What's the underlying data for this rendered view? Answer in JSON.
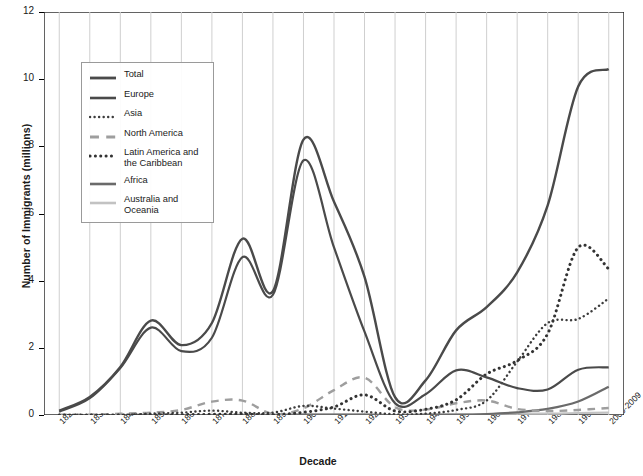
{
  "chart_data": {
    "type": "line",
    "title": "",
    "xlabel": "Decade",
    "ylabel": "Number of Immigrants (millions)",
    "ylim": [
      0,
      12
    ],
    "yticks": [
      0,
      2,
      4,
      6,
      8,
      10,
      12
    ],
    "grid": "vertical",
    "legend_position": "upper-left",
    "categories": [
      "1820-1829",
      "1830-1839",
      "1840-1849",
      "1850-1859",
      "1860-1869",
      "1870-1879",
      "1880-1889",
      "1890-1899",
      "1900-1909",
      "1910-1919",
      "1920-1929",
      "1930-1939",
      "1940-1949",
      "1950-1959",
      "1960-1969",
      "1970-1979",
      "1980-1989",
      "1990-1999",
      "2000-2009"
    ],
    "series": [
      {
        "name": "Total",
        "style": "solid",
        "color": "#4a4a4a",
        "width": 2.4,
        "values": [
          0.13,
          0.54,
          1.43,
          2.81,
          2.08,
          2.74,
          5.25,
          3.69,
          8.2,
          6.35,
          4.11,
          0.53,
          1.03,
          2.52,
          3.21,
          4.25,
          6.24,
          9.78,
          10.3
        ]
      },
      {
        "name": "Europe",
        "style": "solid",
        "color": "#4a4a4a",
        "width": 2.2,
        "values": [
          0.1,
          0.5,
          1.4,
          2.6,
          1.9,
          2.3,
          4.7,
          3.58,
          7.58,
          4.99,
          2.48,
          0.35,
          0.62,
          1.33,
          1.12,
          0.8,
          0.76,
          1.35,
          1.42
        ]
      },
      {
        "name": "Asia",
        "style": "fine-dotted",
        "color": "#3c3c3c",
        "width": 2.4,
        "values": [
          0.0,
          0.0,
          0.0,
          0.04,
          0.07,
          0.13,
          0.07,
          0.07,
          0.27,
          0.19,
          0.1,
          0.02,
          0.04,
          0.15,
          0.43,
          1.59,
          2.74,
          2.86,
          3.47
        ]
      },
      {
        "name": "North America",
        "style": "dashed",
        "color": "#9e9e9e",
        "width": 2.4,
        "values": [
          0.01,
          0.01,
          0.04,
          0.07,
          0.15,
          0.4,
          0.43,
          0.03,
          0.2,
          0.74,
          1.11,
          0.23,
          0.16,
          0.35,
          0.43,
          0.18,
          0.12,
          0.15,
          0.21
        ]
      },
      {
        "name": "Latin America and the Caribbean",
        "style": "dotted",
        "color": "#333333",
        "width": 3.0,
        "values": [
          0.0,
          0.0,
          0.0,
          0.01,
          0.01,
          0.02,
          0.03,
          0.01,
          0.08,
          0.24,
          0.6,
          0.12,
          0.17,
          0.45,
          1.22,
          1.62,
          2.42,
          4.99,
          4.35
        ]
      },
      {
        "name": "Africa",
        "style": "solid",
        "color": "#6a6a6a",
        "width": 2.2,
        "values": [
          0.0,
          0.0,
          0.0,
          0.0,
          0.0,
          0.0,
          0.0,
          0.0,
          0.01,
          0.01,
          0.01,
          0.0,
          0.01,
          0.01,
          0.03,
          0.08,
          0.18,
          0.4,
          0.84
        ]
      },
      {
        "name": "Australia and Oceania",
        "style": "solid",
        "color": "#c2c2c2",
        "width": 2.2,
        "values": [
          0.0,
          0.0,
          0.0,
          0.0,
          0.0,
          0.0,
          0.01,
          0.01,
          0.01,
          0.01,
          0.01,
          0.0,
          0.0,
          0.01,
          0.03,
          0.04,
          0.04,
          0.06,
          0.07
        ]
      }
    ]
  }
}
